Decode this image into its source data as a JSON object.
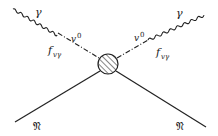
{
  "diagram": {
    "type": "feynman",
    "colors": {
      "ink": "#222222",
      "background": "#ffffff"
    },
    "vertex": {
      "name": "interaction-blob",
      "cx": 108,
      "cy": 64,
      "r": 10,
      "hatched": true
    },
    "labels": {
      "photon_left": "γ",
      "photon_right": "γ",
      "meson_left": "v",
      "meson_left_sup": "0",
      "meson_right": "v",
      "meson_right_sup": "0",
      "coupling_left": "f",
      "coupling_left_sub": "vγ",
      "coupling_right": "f",
      "coupling_right_sub": "vγ",
      "nucleon_left": "𝔑",
      "nucleon_right": "𝔑"
    },
    "lines": [
      {
        "name": "incoming-photon",
        "style": "wavy",
        "from": [
          13,
          9
        ],
        "to": [
          58,
          33
        ]
      },
      {
        "name": "incoming-vector-meson",
        "style": "dash-dot",
        "from": [
          58,
          33
        ],
        "to": [
          99,
          58
        ]
      },
      {
        "name": "outgoing-vector-meson",
        "style": "dash-dot",
        "from": [
          117,
          58
        ],
        "to": [
          148,
          40
        ]
      },
      {
        "name": "outgoing-photon",
        "style": "wavy",
        "from": [
          148,
          40
        ],
        "to": [
          204,
          14
        ]
      },
      {
        "name": "incoming-nucleon",
        "style": "solid",
        "from": [
          15,
          122
        ],
        "to": [
          100,
          71
        ]
      },
      {
        "name": "outgoing-nucleon",
        "style": "solid",
        "from": [
          116,
          71
        ],
        "to": [
          206,
          127
        ]
      }
    ]
  }
}
